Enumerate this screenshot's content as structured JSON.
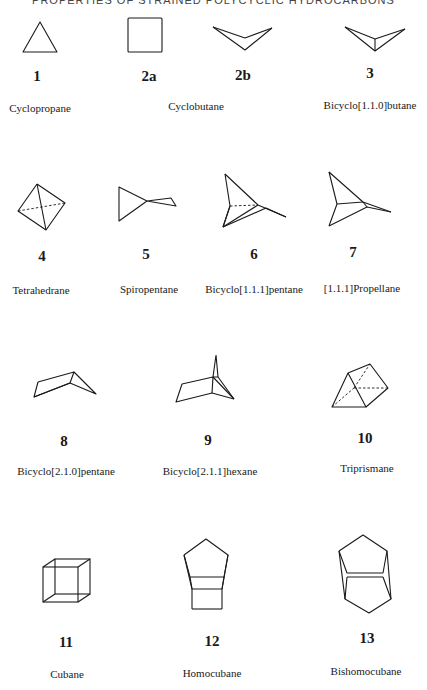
{
  "header": {
    "title": "PROPERTIES OF STRAINED POLYCYCLIC HYDROCARBONS"
  },
  "compounds": [
    {
      "id": "1",
      "name": "Cyclopropane"
    },
    {
      "id": "2a",
      "name": "Cyclobutane"
    },
    {
      "id": "2b",
      "name": ""
    },
    {
      "id": "3",
      "name": "Bicyclo[1.1.0]butane"
    },
    {
      "id": "4",
      "name": "Tetrahedrane"
    },
    {
      "id": "5",
      "name": "Spiropentane"
    },
    {
      "id": "6",
      "name": "Bicyclo[1.1.1]pentane"
    },
    {
      "id": "7",
      "name": "[1.1.1]Propellane"
    },
    {
      "id": "8",
      "name": "Bicyclo[2.1.0]pentane"
    },
    {
      "id": "9",
      "name": "Bicyclo[2.1.1]hexane"
    },
    {
      "id": "10",
      "name": "Triprismane"
    },
    {
      "id": "11",
      "name": "Cubane"
    },
    {
      "id": "12",
      "name": "Homocubane"
    },
    {
      "id": "13",
      "name": "Bishomocubane"
    }
  ]
}
